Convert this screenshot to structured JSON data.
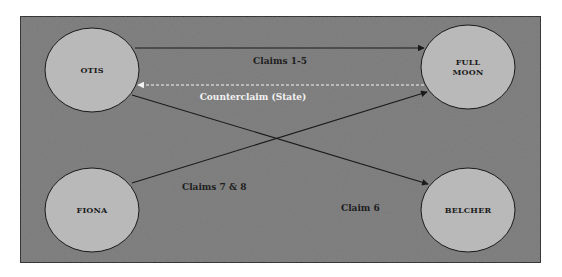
{
  "diagram": {
    "type": "relationship-diagram",
    "colors": {
      "page_background": "#ffffff",
      "panel_background": "#7b7b7b",
      "panel_border": "#2a2a2a",
      "node_fill": "#b9b9b9",
      "node_stroke": "#1a1a1a",
      "edge_dark": "#1a1a1a",
      "edge_light": "#f4f4f4"
    },
    "nodes": [
      {
        "id": "otis",
        "label_lines": [
          "OTIS"
        ],
        "cx": 92,
        "cy": 70,
        "rx": 47,
        "ry": 42
      },
      {
        "id": "full_moon",
        "label_lines": [
          "FULL",
          "MOON"
        ],
        "cx": 468,
        "cy": 67,
        "rx": 47,
        "ry": 42
      },
      {
        "id": "fiona",
        "label_lines": [
          "FIONA"
        ],
        "cx": 92,
        "cy": 210,
        "rx": 47,
        "ry": 42
      },
      {
        "id": "belcher",
        "label_lines": [
          "BELCHER"
        ],
        "cx": 468,
        "cy": 210,
        "rx": 47,
        "ry": 42
      }
    ],
    "edges": [
      {
        "id": "claims_1_5",
        "from": "otis",
        "to": "full_moon",
        "label": "Claims 1-5",
        "style": "solid",
        "color": "dark"
      },
      {
        "id": "counterclaim",
        "from": "full_moon",
        "to": "otis",
        "label": "Counterclaim (State)",
        "style": "dashed",
        "color": "light"
      },
      {
        "id": "claim_6",
        "from": "otis",
        "to": "belcher",
        "label": "Claim 6",
        "style": "solid",
        "color": "dark"
      },
      {
        "id": "claims_7_8",
        "from": "fiona",
        "to": "full_moon",
        "label": "Claims 7 & 8",
        "style": "solid",
        "color": "dark"
      }
    ]
  },
  "labels": {
    "otis": "OTIS",
    "full_moon_line1": "FULL",
    "full_moon_line2": "MOON",
    "fiona": "FIONA",
    "belcher": "BELCHER",
    "claims_1_5": "Claims 1-5",
    "counterclaim": "Counterclaim (State)",
    "claims_7_8": "Claims 7 & 8",
    "claim_6": "Claim 6"
  }
}
